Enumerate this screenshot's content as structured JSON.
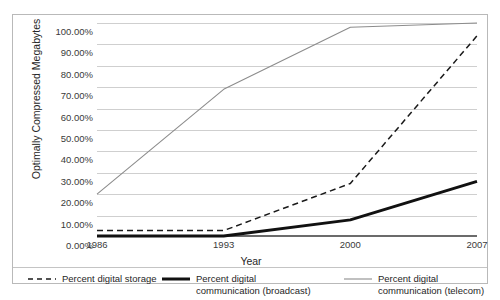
{
  "chart_data": {
    "type": "line",
    "title": "",
    "xlabel": "Year",
    "ylabel": "Optimally Compressed Megabytes",
    "x": [
      1986,
      1993,
      2000,
      2007
    ],
    "xticklabels": [
      "1986",
      "1993",
      "2000",
      "2007"
    ],
    "yticklabels": [
      "0.00%",
      "10.00%",
      "20.00%",
      "30.00%",
      "40.00%",
      "50.00%",
      "60.00%",
      "70.00%",
      "80.00%",
      "90.00%",
      "100.00%"
    ],
    "ytickvalues": [
      0,
      10,
      20,
      30,
      40,
      50,
      60,
      70,
      80,
      90,
      100
    ],
    "ylim": [
      0,
      100
    ],
    "xlim": [
      1986,
      2007
    ],
    "grid": "horizontal",
    "legend_position": "bottom",
    "series": [
      {
        "name": "Percent digital storage",
        "style": "dashed",
        "color": "#1a1a1a",
        "values": [
          3,
          3,
          25,
          94
        ]
      },
      {
        "name": "Percent digital communication (broadcast)",
        "style": "solid-thick",
        "color": "#111111",
        "values": [
          0.5,
          0.5,
          8,
          26
        ]
      },
      {
        "name": "Percent digital communication (telecom)",
        "style": "solid-thin",
        "color": "#8c8c8c",
        "values": [
          20,
          69,
          98,
          100
        ]
      }
    ]
  },
  "legend": {
    "entries": [
      {
        "label": "Percent digital storage",
        "swatch": "dashed-line-swatch"
      },
      {
        "label": "Percent digital communication (broadcast)",
        "swatch": "thick-solid-line-swatch"
      },
      {
        "label": "Percent digital communication (telecom)",
        "swatch": "thin-solid-line-swatch"
      }
    ]
  }
}
